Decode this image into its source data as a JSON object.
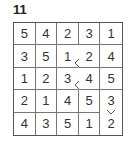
{
  "puzzle_number": "11",
  "grid": [
    [
      "5",
      "4",
      "2",
      "3",
      "1"
    ],
    [
      "3",
      "5",
      "1",
      "2",
      "4"
    ],
    [
      "1",
      "2",
      "3",
      "4",
      "5"
    ],
    [
      "2",
      "1",
      "4",
      "5",
      "3"
    ],
    [
      "4",
      "3",
      "5",
      "1",
      "2"
    ]
  ],
  "inequalities": [
    {
      "between": "row 2 col 3 and row 2 col 4",
      "sign": "<"
    },
    {
      "between": "row 3 col 3 and row 3 col 4",
      "sign": "<"
    },
    {
      "between": "row 4 col 5 and row 5 col 5",
      "sign": "v"
    }
  ]
}
